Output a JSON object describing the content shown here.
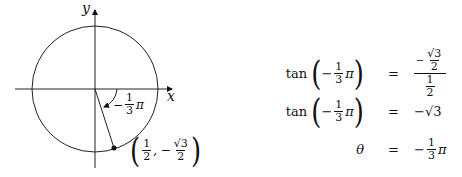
{
  "diagram": {
    "axis_labels": {
      "x": "x",
      "y": "y"
    },
    "angle_label": {
      "sign": "−",
      "num": "1",
      "den": "3",
      "sym": "π"
    },
    "point_label": {
      "x_num": "1",
      "x_den": "2",
      "y_sign": "−",
      "y_num": "√3",
      "y_den": "2"
    },
    "circle": {
      "cx": 95,
      "cy": 89,
      "r": 63
    },
    "point": {
      "x": 114,
      "y": 148
    }
  },
  "equations": [
    {
      "lhs_fn": "tan",
      "lhs_sign": "−",
      "lhs_num": "1",
      "lhs_den": "3",
      "lhs_sym": "π",
      "eq": "=",
      "rhs_type": "complex_fraction",
      "rhs_top_sign": "−",
      "rhs_top_num": "√3",
      "rhs_top_den": "2",
      "rhs_bot_num": "1",
      "rhs_bot_den": "2"
    },
    {
      "lhs_fn": "tan",
      "lhs_sign": "−",
      "lhs_num": "1",
      "lhs_den": "3",
      "lhs_sym": "π",
      "eq": "=",
      "rhs": "−√3"
    },
    {
      "lhs_var": "θ",
      "eq": "=",
      "rhs_sign": "−",
      "rhs_num": "1",
      "rhs_den": "3",
      "rhs_sym": "π"
    }
  ]
}
